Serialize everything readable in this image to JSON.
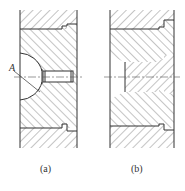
{
  "figure": {
    "panels": [
      {
        "id": "a",
        "caption": "(a)",
        "section_marker": "A"
      },
      {
        "id": "b",
        "caption": "(b)"
      }
    ]
  },
  "colors": {
    "line": "#333333",
    "hatch": "#555555",
    "background": "#ffffff"
  }
}
